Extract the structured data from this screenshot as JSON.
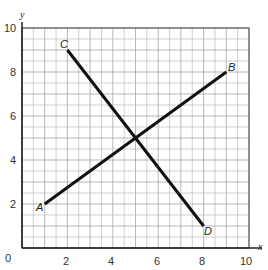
{
  "chart_data": {
    "type": "line",
    "title": "",
    "xlabel": "x",
    "ylabel": "y",
    "xlim": [
      0,
      10
    ],
    "ylim": [
      0,
      10
    ],
    "grid": true,
    "grid_step": 0.5,
    "x_ticks": [
      "0",
      "2",
      "4",
      "6",
      "8",
      "10"
    ],
    "y_ticks": [
      "0",
      "2",
      "4",
      "6",
      "8",
      "10"
    ],
    "series": [
      {
        "name": "AB",
        "points": [
          {
            "label": "A",
            "x": 1,
            "y": 2
          },
          {
            "label": "B",
            "x": 9,
            "y": 8
          }
        ]
      },
      {
        "name": "CD",
        "points": [
          {
            "label": "C",
            "x": 2,
            "y": 9
          },
          {
            "label": "D",
            "x": 8,
            "y": 1
          }
        ]
      }
    ]
  },
  "labels": {
    "origin": "0",
    "x_axis": "x",
    "y_axis": "y",
    "A": "A",
    "B": "B",
    "C": "C",
    "D": "D",
    "x2": "2",
    "x4": "4",
    "x6": "6",
    "x8": "8",
    "x10": "10",
    "y2": "2",
    "y4": "4",
    "y6": "6",
    "y8": "8",
    "y10": "10"
  }
}
